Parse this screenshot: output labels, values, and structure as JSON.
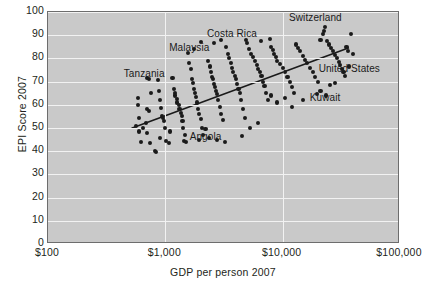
{
  "chart_data": {
    "type": "scatter",
    "title": "",
    "xlabel": "GDP per person 2007",
    "ylabel": "EPI Score 2007",
    "xscale": "log",
    "xlim": [
      100,
      100000
    ],
    "ylim": [
      0,
      100
    ],
    "grid": true,
    "legend": "none",
    "xticks": [
      "$100",
      "$1,000",
      "$10,000",
      "$100,000"
    ],
    "xtick_values": [
      100,
      1000,
      10000,
      100000
    ],
    "yticks": [
      "0",
      "10",
      "20",
      "30",
      "40",
      "50",
      "60",
      "70",
      "80",
      "90",
      "100"
    ],
    "ytick_values": [
      0,
      10,
      20,
      30,
      40,
      50,
      60,
      70,
      80,
      90,
      100
    ],
    "trendline": {
      "x": [
        520,
        38000
      ],
      "y": [
        49.5,
        84.5
      ]
    },
    "annotations": [
      {
        "label": "Tanzania",
        "x": 660,
        "y": 73.5
      },
      {
        "label": "Malaysia",
        "x": 1600,
        "y": 84.5
      },
      {
        "label": "Costa Rica",
        "x": 3700,
        "y": 90.5
      },
      {
        "label": "Switzerland",
        "x": 19000,
        "y": 97.5
      },
      {
        "label": "United States",
        "x": 37000,
        "y": 75.5
      },
      {
        "label": "Kuwait",
        "x": 23000,
        "y": 63.0
      },
      {
        "label": "Angola",
        "x": 2200,
        "y": 46.0
      }
    ],
    "points": [
      {
        "x": 590,
        "y": 63.0
      },
      {
        "x": 585,
        "y": 60.0
      },
      {
        "x": 600,
        "y": 54.5
      },
      {
        "x": 600,
        "y": 48.5
      },
      {
        "x": 615,
        "y": 44.0
      },
      {
        "x": 700,
        "y": 71.5
      },
      {
        "x": 720,
        "y": 71.0
      },
      {
        "x": 760,
        "y": 65.0
      },
      {
        "x": 700,
        "y": 58.0
      },
      {
        "x": 720,
        "y": 57.5
      },
      {
        "x": 690,
        "y": 52.0
      },
      {
        "x": 700,
        "y": 48.0
      },
      {
        "x": 740,
        "y": 43.5
      },
      {
        "x": 810,
        "y": 40.0
      },
      {
        "x": 830,
        "y": 39.5
      },
      {
        "x": 860,
        "y": 70.5
      },
      {
        "x": 880,
        "y": 66.0
      },
      {
        "x": 900,
        "y": 62.0
      },
      {
        "x": 920,
        "y": 58.5
      },
      {
        "x": 940,
        "y": 55.0
      },
      {
        "x": 950,
        "y": 54.5
      },
      {
        "x": 980,
        "y": 53.0
      },
      {
        "x": 1000,
        "y": 50.0
      },
      {
        "x": 1020,
        "y": 44.5
      },
      {
        "x": 1080,
        "y": 43.5
      },
      {
        "x": 1150,
        "y": 71.5
      },
      {
        "x": 1180,
        "y": 67.0
      },
      {
        "x": 1200,
        "y": 65.0
      },
      {
        "x": 1210,
        "y": 64.0
      },
      {
        "x": 1250,
        "y": 62.5
      },
      {
        "x": 1260,
        "y": 61.0
      },
      {
        "x": 1300,
        "y": 60.0
      },
      {
        "x": 1320,
        "y": 58.0
      },
      {
        "x": 1350,
        "y": 56.5
      },
      {
        "x": 1380,
        "y": 55.0
      },
      {
        "x": 1400,
        "y": 53.0
      },
      {
        "x": 1420,
        "y": 50.0
      },
      {
        "x": 1450,
        "y": 44.5
      },
      {
        "x": 1500,
        "y": 44.0
      },
      {
        "x": 1550,
        "y": 82.5
      },
      {
        "x": 1600,
        "y": 78.0
      },
      {
        "x": 1650,
        "y": 75.5
      },
      {
        "x": 1700,
        "y": 71.0
      },
      {
        "x": 1720,
        "y": 69.5
      },
      {
        "x": 1750,
        "y": 67.0
      },
      {
        "x": 1800,
        "y": 65.0
      },
      {
        "x": 1830,
        "y": 63.5
      },
      {
        "x": 1850,
        "y": 61.0
      },
      {
        "x": 1900,
        "y": 58.0
      },
      {
        "x": 1950,
        "y": 56.0
      },
      {
        "x": 2000,
        "y": 54.0
      },
      {
        "x": 2050,
        "y": 50.0
      },
      {
        "x": 2100,
        "y": 47.0
      },
      {
        "x": 2200,
        "y": 49.5
      },
      {
        "x": 2300,
        "y": 79.0
      },
      {
        "x": 2400,
        "y": 76.5
      },
      {
        "x": 2450,
        "y": 74.0
      },
      {
        "x": 2500,
        "y": 72.0
      },
      {
        "x": 2550,
        "y": 71.0
      },
      {
        "x": 2600,
        "y": 69.0
      },
      {
        "x": 2650,
        "y": 67.5
      },
      {
        "x": 2700,
        "y": 66.0
      },
      {
        "x": 2750,
        "y": 64.5
      },
      {
        "x": 2800,
        "y": 62.0
      },
      {
        "x": 2900,
        "y": 59.0
      },
      {
        "x": 3000,
        "y": 56.0
      },
      {
        "x": 3100,
        "y": 53.5
      },
      {
        "x": 3300,
        "y": 85.0
      },
      {
        "x": 3400,
        "y": 82.0
      },
      {
        "x": 3500,
        "y": 80.0
      },
      {
        "x": 3600,
        "y": 78.0
      },
      {
        "x": 3700,
        "y": 76.0
      },
      {
        "x": 3800,
        "y": 74.0
      },
      {
        "x": 3900,
        "y": 72.5
      },
      {
        "x": 4000,
        "y": 71.0
      },
      {
        "x": 4100,
        "y": 69.0
      },
      {
        "x": 4200,
        "y": 67.0
      },
      {
        "x": 4300,
        "y": 65.0
      },
      {
        "x": 4400,
        "y": 62.0
      },
      {
        "x": 4600,
        "y": 58.0
      },
      {
        "x": 4800,
        "y": 54.5
      },
      {
        "x": 5000,
        "y": 86.5
      },
      {
        "x": 5200,
        "y": 84.0
      },
      {
        "x": 5400,
        "y": 82.0
      },
      {
        "x": 5600,
        "y": 80.5
      },
      {
        "x": 5800,
        "y": 79.0
      },
      {
        "x": 6000,
        "y": 77.0
      },
      {
        "x": 6200,
        "y": 75.5
      },
      {
        "x": 6400,
        "y": 74.0
      },
      {
        "x": 6600,
        "y": 72.5
      },
      {
        "x": 6800,
        "y": 70.0
      },
      {
        "x": 7000,
        "y": 68.0
      },
      {
        "x": 7200,
        "y": 65.0
      },
      {
        "x": 7500,
        "y": 62.0
      },
      {
        "x": 8000,
        "y": 85.0
      },
      {
        "x": 8200,
        "y": 83.5
      },
      {
        "x": 8500,
        "y": 82.0
      },
      {
        "x": 8800,
        "y": 80.5
      },
      {
        "x": 9000,
        "y": 79.0
      },
      {
        "x": 9500,
        "y": 77.5
      },
      {
        "x": 10000,
        "y": 76.0
      },
      {
        "x": 10500,
        "y": 74.0
      },
      {
        "x": 11000,
        "y": 72.0
      },
      {
        "x": 11500,
        "y": 70.0
      },
      {
        "x": 12000,
        "y": 67.5
      },
      {
        "x": 12500,
        "y": 65.0
      },
      {
        "x": 13000,
        "y": 86.0
      },
      {
        "x": 13500,
        "y": 84.5
      },
      {
        "x": 14000,
        "y": 83.0
      },
      {
        "x": 15000,
        "y": 81.0
      },
      {
        "x": 15500,
        "y": 79.5
      },
      {
        "x": 16000,
        "y": 78.0
      },
      {
        "x": 17000,
        "y": 76.0
      },
      {
        "x": 18000,
        "y": 74.0
      },
      {
        "x": 19000,
        "y": 72.0
      },
      {
        "x": 20000,
        "y": 70.0
      },
      {
        "x": 21000,
        "y": 88.0
      },
      {
        "x": 22000,
        "y": 90.5
      },
      {
        "x": 22500,
        "y": 92.0
      },
      {
        "x": 23000,
        "y": 93.5
      },
      {
        "x": 24000,
        "y": 87.5
      },
      {
        "x": 25000,
        "y": 86.0
      },
      {
        "x": 26000,
        "y": 84.5
      },
      {
        "x": 27000,
        "y": 83.0
      },
      {
        "x": 28000,
        "y": 81.5
      },
      {
        "x": 29000,
        "y": 80.0
      },
      {
        "x": 30000,
        "y": 78.5
      },
      {
        "x": 31000,
        "y": 77.0
      },
      {
        "x": 32000,
        "y": 75.5
      },
      {
        "x": 33000,
        "y": 74.0
      },
      {
        "x": 34000,
        "y": 72.5
      },
      {
        "x": 35000,
        "y": 85.0
      },
      {
        "x": 36000,
        "y": 83.0
      },
      {
        "x": 38000,
        "y": 90.5
      },
      {
        "x": 40000,
        "y": 82.0
      },
      {
        "x": 23500,
        "y": 64.0
      },
      {
        "x": 36500,
        "y": 76.5
      },
      {
        "x": 2350,
        "y": 45.5
      },
      {
        "x": 1950,
        "y": 45.0
      },
      {
        "x": 2750,
        "y": 45.0
      },
      {
        "x": 3200,
        "y": 44.0
      },
      {
        "x": 4500,
        "y": 46.5
      },
      {
        "x": 1480,
        "y": 47.0
      },
      {
        "x": 900,
        "y": 45.5
      },
      {
        "x": 560,
        "y": 51.0
      },
      {
        "x": 640,
        "y": 50.0
      },
      {
        "x": 1100,
        "y": 48.5
      },
      {
        "x": 5300,
        "y": 50.0
      },
      {
        "x": 6200,
        "y": 52.0
      },
      {
        "x": 9000,
        "y": 61.0
      },
      {
        "x": 12000,
        "y": 59.0
      },
      {
        "x": 15000,
        "y": 62.0
      },
      {
        "x": 19500,
        "y": 64.5
      },
      {
        "x": 21000,
        "y": 66.0
      },
      {
        "x": 25500,
        "y": 68.5
      },
      {
        "x": 28000,
        "y": 69.5
      },
      {
        "x": 8000,
        "y": 64.0
      },
      {
        "x": 10500,
        "y": 63.0
      },
      {
        "x": 3000,
        "y": 88.0
      },
      {
        "x": 2600,
        "y": 86.5
      },
      {
        "x": 1750,
        "y": 84.0
      },
      {
        "x": 6500,
        "y": 87.5
      },
      {
        "x": 7800,
        "y": 88.5
      },
      {
        "x": 4900,
        "y": 88.0
      },
      {
        "x": 2000,
        "y": 87.0
      }
    ]
  }
}
